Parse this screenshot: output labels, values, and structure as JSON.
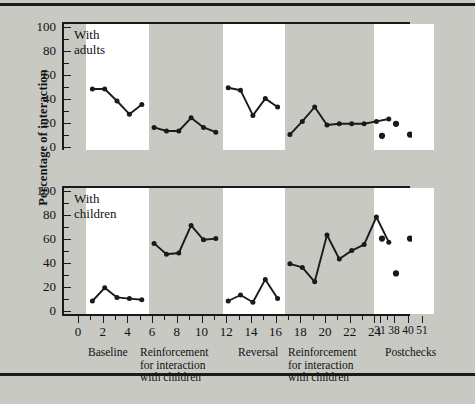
{
  "figure": {
    "ylabel": "Percentage of interaction",
    "y_ticks": [
      "0",
      "20",
      "40",
      "60",
      "80",
      "100"
    ],
    "panel_notes": {
      "top": "With\nadults",
      "bottom": "With\nchildren"
    },
    "x_tick_labels": [
      "0",
      "2",
      "4",
      "6",
      "8",
      "10",
      "12",
      "14",
      "16",
      "18",
      "20",
      "22",
      "24"
    ],
    "postcheck_tick_labels": [
      "31",
      "38",
      "40",
      "51"
    ],
    "phase_labels": [
      "Baseline",
      "Reinforcement\nfor interaction\nwith children",
      "Reversal",
      "Reinforcement\nfor interaction\nwith children",
      "Postchecks"
    ],
    "colors": {
      "background": "#c9c9c4",
      "panel_light": "#ffffff",
      "panel_shaded": "#c9c9c4",
      "ink": "#1a1a1a"
    }
  },
  "chart_data": [
    {
      "type": "line",
      "title": "With adults",
      "xlabel": "Sessions",
      "ylabel": "Percentage of interaction",
      "ylim": [
        0,
        100
      ],
      "xlim": [
        0,
        26
      ],
      "grid": false,
      "legend": "none",
      "phases": [
        {
          "name": "Baseline",
          "x": [
            1,
            2,
            3,
            4,
            5
          ],
          "values": [
            50,
            50,
            40,
            29,
            37
          ],
          "shaded": false,
          "connected": true
        },
        {
          "name": "Reinforcement for interaction with children",
          "x": [
            6,
            7,
            8,
            9,
            10,
            11
          ],
          "values": [
            18,
            15,
            15,
            26,
            18,
            14
          ],
          "shaded": true,
          "connected": true
        },
        {
          "name": "Reversal",
          "x": [
            12,
            13,
            14,
            15,
            16
          ],
          "values": [
            51,
            49,
            28,
            42,
            35
          ],
          "shaded": false,
          "connected": true
        },
        {
          "name": "Reinforcement for interaction with children",
          "x": [
            17,
            18,
            19,
            20,
            21,
            22,
            23,
            24,
            25
          ],
          "values": [
            12,
            23,
            35,
            20,
            21,
            21,
            21,
            23,
            25
          ],
          "shaded": true,
          "connected": true
        },
        {
          "name": "Postchecks",
          "x": [
            31,
            38,
            40,
            51
          ],
          "values": [
            11,
            21,
            12,
            20
          ],
          "shaded": false,
          "connected": false
        }
      ]
    },
    {
      "type": "line",
      "title": "With children",
      "xlabel": "Sessions",
      "ylabel": "Percentage of interaction",
      "ylim": [
        0,
        100
      ],
      "xlim": [
        0,
        26
      ],
      "grid": false,
      "legend": "none",
      "phases": [
        {
          "name": "Baseline",
          "x": [
            1,
            2,
            3,
            4,
            5
          ],
          "values": [
            10,
            21,
            13,
            12,
            11
          ],
          "shaded": false,
          "connected": true
        },
        {
          "name": "Reinforcement for interaction with children",
          "x": [
            6,
            7,
            8,
            9,
            10,
            11
          ],
          "values": [
            58,
            49,
            50,
            73,
            61,
            62
          ],
          "shaded": true,
          "connected": true
        },
        {
          "name": "Reversal",
          "x": [
            12,
            13,
            14,
            15,
            16
          ],
          "values": [
            10,
            15,
            9,
            28,
            12
          ],
          "shaded": false,
          "connected": true
        },
        {
          "name": "Reinforcement for interaction with children",
          "x": [
            17,
            18,
            19,
            20,
            21,
            22,
            23,
            24,
            25
          ],
          "values": [
            41,
            38,
            26,
            65,
            45,
            52,
            57,
            80,
            59
          ],
          "shaded": true,
          "connected": true
        },
        {
          "name": "Postchecks",
          "x": [
            31,
            38,
            40,
            51
          ],
          "values": [
            62,
            33,
            62,
            51
          ],
          "shaded": false,
          "connected": false
        }
      ]
    }
  ]
}
